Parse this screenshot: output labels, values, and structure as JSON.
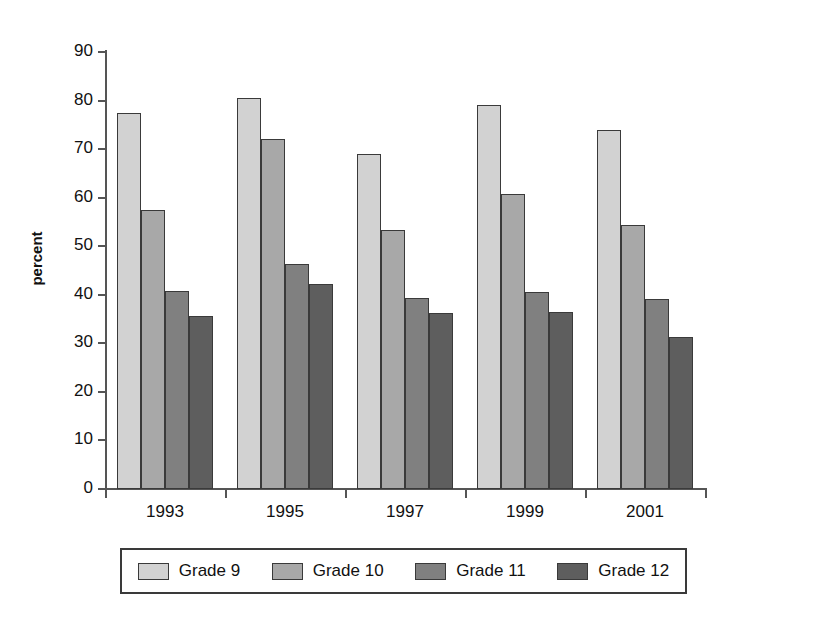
{
  "chart_data": {
    "type": "bar",
    "title": "",
    "subtitle": "",
    "xlabel": "",
    "ylabel": "percent",
    "categories": [
      "1993",
      "1995",
      "1997",
      "1999",
      "2001"
    ],
    "series": [
      {
        "name": "Grade 9",
        "color": "#d2d2d2",
        "values": [
          77.5,
          80.5,
          69.0,
          79.0,
          74.0
        ]
      },
      {
        "name": "Grade 10",
        "color": "#a8a8a8",
        "values": [
          57.5,
          72.0,
          53.3,
          60.8,
          54.4
        ]
      },
      {
        "name": "Grade 11",
        "color": "#808080",
        "values": [
          40.7,
          46.4,
          39.3,
          40.6,
          39.2
        ]
      },
      {
        "name": "Grade 12",
        "color": "#5e5e5e",
        "values": [
          35.6,
          42.3,
          36.2,
          36.5,
          31.4
        ]
      }
    ],
    "ylim": [
      0,
      90
    ],
    "yticks": [
      0,
      10,
      20,
      30,
      40,
      50,
      60,
      70,
      80,
      90
    ],
    "ytick_labels": [
      "0",
      "10",
      "20",
      "30",
      "40",
      "50",
      "60",
      "70",
      "80",
      "90"
    ],
    "grid": false,
    "legend_position": "bottom"
  },
  "legend": {
    "entries": [
      {
        "label": "Grade 9"
      },
      {
        "label": "Grade 10"
      },
      {
        "label": "Grade 11"
      },
      {
        "label": "Grade 12"
      }
    ]
  }
}
